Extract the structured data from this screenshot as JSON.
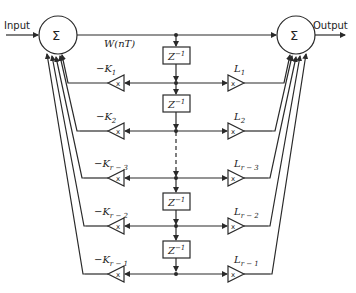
{
  "diagram": {
    "input_label": "Input",
    "output_label": "Output",
    "sum_symbol": "Σ",
    "state_label": "W(nT)",
    "multiplier_symbol": "x",
    "delay_label_base": "Z",
    "delay_label_exp": "−1",
    "stroke_color": "#2a2a2a",
    "rows": [
      {
        "k_label": "−K",
        "k_sub": "1",
        "l_label": "L",
        "l_sub": "1"
      },
      {
        "k_label": "−K",
        "k_sub": "2",
        "l_label": "L",
        "l_sub": "2"
      },
      {
        "k_label": "−K",
        "k_sub": "r − 3",
        "l_label": "L",
        "l_sub": "r − 3"
      },
      {
        "k_label": "−K",
        "k_sub": "r − 2",
        "l_label": "L",
        "l_sub": "r − 2"
      },
      {
        "k_label": "−K",
        "k_sub": "r − 1",
        "l_label": "L",
        "l_sub": "r − 1"
      }
    ]
  }
}
